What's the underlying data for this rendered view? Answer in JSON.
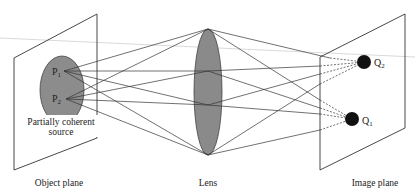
{
  "diagram": {
    "labels": {
      "object_plane": "Object plane",
      "lens": "Lens",
      "image_plane": "Image plane",
      "source_line1": "Partially coherent",
      "source_line2": "source",
      "p1": "P",
      "p1_sub": "1",
      "p2": "P",
      "p2_sub": "2",
      "q1": "Q",
      "q1_sub": "1",
      "q2": "Q",
      "q2_sub": "2"
    },
    "colors": {
      "source_fill": "#8c8c8c",
      "lens_fill": "#8a8a8a",
      "image_point": "#111111",
      "line": "#333333"
    }
  }
}
